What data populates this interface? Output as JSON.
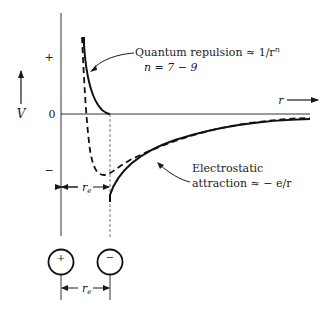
{
  "diagram": {
    "axes": {
      "y_label": "V",
      "x_label": "r",
      "zero_label": "0",
      "plus_label": "+",
      "minus_label": "−"
    },
    "annotations": {
      "repulsion_line1": "Quantum repulsion ≈ 1/r",
      "repulsion_exp": "n",
      "repulsion_line2": "n = 7 − 9",
      "attraction_line1": "Electrostatic",
      "attraction_line2": "attraction ≈ − e/r",
      "equilibrium_label": "r",
      "equilibrium_sub": "e"
    },
    "ions": {
      "positive_sign": "+",
      "negative_sign": "−",
      "separation_label": "r",
      "separation_sub": "e"
    },
    "curves": [
      {
        "name": "quantum-repulsion",
        "style": "solid"
      },
      {
        "name": "electrostatic-attraction",
        "style": "solid"
      },
      {
        "name": "total-potential",
        "style": "dashed"
      }
    ]
  }
}
